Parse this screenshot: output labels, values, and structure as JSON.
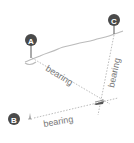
{
  "diagram": {
    "title": "",
    "markers": [
      {
        "id": "A",
        "label": "A"
      },
      {
        "id": "B",
        "label": "B"
      },
      {
        "id": "C",
        "label": "C"
      }
    ],
    "bearing_labels": [
      {
        "from": "A",
        "text": "bearing"
      },
      {
        "from": "C",
        "text": "bearing"
      },
      {
        "from": "B",
        "text": "bearing"
      }
    ],
    "colors": {
      "marker": "#4a4a4a",
      "line": "#aaaaaa",
      "text": "#777777",
      "trail": "#bbbbbb"
    }
  }
}
